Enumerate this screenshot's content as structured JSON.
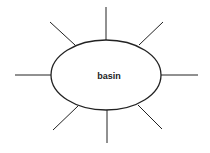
{
  "diagram": {
    "center_label": "basin",
    "stroke_color": "#222222",
    "background": "#ffffff",
    "node": {
      "shape": "ellipse",
      "cx": 106,
      "cy": 75,
      "rx": 55,
      "ry": 35
    },
    "spokes": [
      {
        "name": "top",
        "x1": 106,
        "y1": 7,
        "x2": 106,
        "y2": 40
      },
      {
        "name": "top-right",
        "x1": 163,
        "y1": 22,
        "x2": 139,
        "y2": 45
      },
      {
        "name": "right",
        "x1": 161,
        "y1": 75,
        "x2": 198,
        "y2": 75
      },
      {
        "name": "bottom-right",
        "x1": 138,
        "y1": 105,
        "x2": 162,
        "y2": 129
      },
      {
        "name": "bottom",
        "x1": 107,
        "y1": 110,
        "x2": 107,
        "y2": 143
      },
      {
        "name": "bottom-left",
        "x1": 78,
        "y1": 106,
        "x2": 53,
        "y2": 130
      },
      {
        "name": "left",
        "x1": 15,
        "y1": 75,
        "x2": 51,
        "y2": 75
      },
      {
        "name": "top-left",
        "x1": 50,
        "y1": 22,
        "x2": 75,
        "y2": 45
      }
    ]
  }
}
